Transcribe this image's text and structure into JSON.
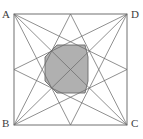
{
  "figure": {
    "type": "geometric-diagram",
    "labels": {
      "top_left": "A",
      "top_right": "D",
      "bottom_left": "B",
      "bottom_right": "C"
    },
    "colors": {
      "line": "#6b6b6b",
      "square_border": "#707070",
      "octagon_fill": "#b0b0b0",
      "octagon_stroke": "#6b6b6b",
      "label_text": "#3d3d3d",
      "background": "#ffffff"
    },
    "square": {
      "left": 14,
      "top": 14,
      "right": 127,
      "bottom": 125,
      "width": 113,
      "height": 111,
      "stroke_width": 1
    },
    "points": {
      "A": [
        14,
        14
      ],
      "D": [
        127,
        14
      ],
      "C": [
        127,
        125
      ],
      "B": [
        14,
        125
      ],
      "M_top": [
        70.5,
        14
      ],
      "M_right": [
        127,
        69.5
      ],
      "M_bottom": [
        70.5,
        125
      ],
      "M_left": [
        14,
        69.5
      ]
    },
    "star_lines": [
      {
        "name": "A-to-right-midpoint",
        "from": "A",
        "to": "M_right"
      },
      {
        "name": "A-to-bottom-midpoint",
        "from": "A",
        "to": "M_bottom"
      },
      {
        "name": "A-to-C-diagonal",
        "from": "A",
        "to": "C"
      },
      {
        "name": "D-to-left-midpoint",
        "from": "D",
        "to": "M_left"
      },
      {
        "name": "D-to-bottom-midpoint",
        "from": "D",
        "to": "M_bottom"
      },
      {
        "name": "D-to-B-diagonal",
        "from": "D",
        "to": "B"
      },
      {
        "name": "C-to-left-midpoint",
        "from": "C",
        "to": "M_left"
      },
      {
        "name": "C-to-top-midpoint",
        "from": "C",
        "to": "M_top"
      },
      {
        "name": "B-to-right-midpoint",
        "from": "B",
        "to": "M_right"
      },
      {
        "name": "B-to-top-midpoint",
        "from": "B",
        "to": "M_top"
      }
    ],
    "octagon": {
      "fill": "#b0b0b0",
      "points": "57,45 85,45 88,57 88,81 85,93 57,93 45,81 45,57",
      "bounds": {
        "left": 45,
        "top": 45,
        "right": 88,
        "bottom": 93
      }
    }
  }
}
